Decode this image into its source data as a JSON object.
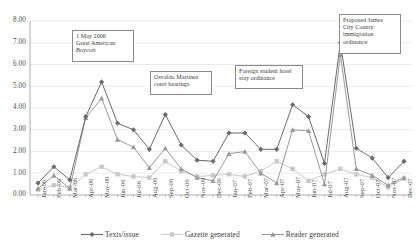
{
  "chart_data": {
    "type": "line",
    "title": "",
    "xlabel": "",
    "ylabel": "",
    "ylim": [
      0.0,
      8.0
    ],
    "ytick_step": 1.0,
    "grid": true,
    "legend_position": "bottom",
    "ytick_labels": [
      "8.00",
      "7.00",
      "6.00",
      "5.00",
      "4.00",
      "3.00",
      "2.00",
      "1.00",
      "0.00"
    ],
    "categories": [
      "Jan-06",
      "Feb-06",
      "Mar-06",
      "Apr-06",
      "May-06",
      "Jun-06",
      "Jul-06",
      "Aug-06",
      "Sep-06",
      "Oct-06",
      "Nov-06",
      "Dec-06",
      "Jan-07",
      "Feb-07",
      "Mar-07",
      "Apr-07",
      "May-07",
      "Jun-07",
      "Jul-07",
      "Aug-07",
      "Sep-07",
      "Oct-07",
      "Nov-07",
      "Dec-07"
    ],
    "series": [
      {
        "name": "Texts/issue",
        "color": "#6b6b6b",
        "marker": "diamond",
        "values": [
          0.55,
          1.3,
          0.7,
          3.6,
          5.2,
          3.3,
          3.0,
          2.1,
          3.7,
          2.3,
          1.6,
          1.55,
          2.85,
          2.85,
          2.1,
          2.1,
          4.15,
          3.6,
          1.45,
          7.0,
          2.15,
          1.7,
          0.8,
          1.55
        ],
        "data_labels": false
      },
      {
        "name": "Gazette generated",
        "color": "#c9c9c9",
        "marker": "square",
        "values": [
          0.25,
          0.45,
          0.35,
          0.95,
          1.3,
          0.95,
          0.85,
          0.8,
          1.55,
          1.1,
          0.85,
          0.9,
          0.95,
          0.85,
          1.1,
          1.55,
          1.2,
          0.65,
          0.95,
          1.2,
          0.95,
          0.8,
          0.35,
          0.75
        ],
        "data_labels": false
      },
      {
        "name": "Reader generated",
        "color": "#9a9a9a",
        "marker": "triangle",
        "values": [
          0.3,
          0.9,
          0.3,
          3.55,
          4.45,
          2.55,
          2.2,
          1.25,
          2.15,
          1.2,
          0.8,
          0.65,
          1.9,
          2.0,
          1.0,
          0.55,
          3.0,
          2.95,
          0.5,
          6.45,
          1.2,
          0.9,
          0.45,
          0.8
        ],
        "data_labels": false
      }
    ],
    "annotations": [
      {
        "id": "annotation-great-american-boycott",
        "text": "1 May 2006\nGreat American\nBoycott",
        "line1": "1 May 2006",
        "line2": "Great American",
        "line3": "Boycott",
        "anchor_category": "May-06"
      },
      {
        "id": "annotation-osvaldo-martinez",
        "text": "Osvaldo Martinez\ncourt hearings",
        "line1": "Osvaldo Martinez",
        "line2": "court hearings",
        "line3": "",
        "anchor_category": "Sep-06"
      },
      {
        "id": "annotation-foreign-student-hotel",
        "text": "Foreign student hotel\nstay ordinance",
        "line1": "Foreign student hotel",
        "line2": "stay ordinance",
        "line3": "",
        "anchor_category": "May-07"
      },
      {
        "id": "annotation-jcc-immigration-ordinance",
        "text": "Proposed James\nCity County\nimmigration\nordinance",
        "line1": "Proposed James",
        "line2": "City County",
        "line3": "immigration",
        "line4": "ordinance",
        "anchor_category": "Aug-07"
      }
    ]
  }
}
